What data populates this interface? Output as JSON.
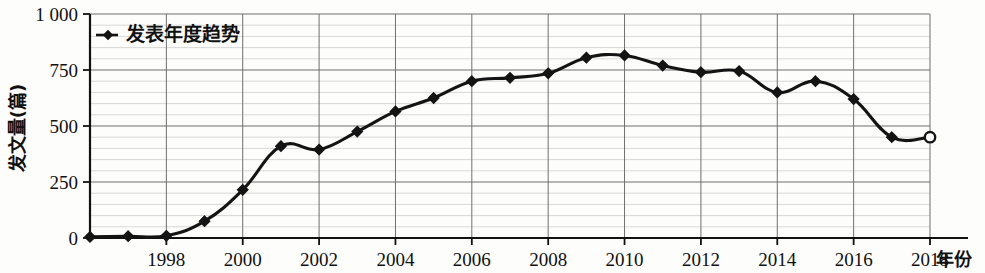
{
  "chart_data": {
    "type": "line",
    "title": "",
    "xlabel": "年份",
    "ylabel": "发文量(篇)",
    "xlim": [
      1996,
      2018
    ],
    "ylim": [
      0,
      1000
    ],
    "yticks": [
      0,
      250,
      500,
      750,
      1000
    ],
    "ytick_labels": [
      "0",
      "250",
      "500",
      "750",
      "1 000"
    ],
    "xticks": [
      1998,
      2000,
      2002,
      2004,
      2006,
      2008,
      2010,
      2012,
      2014,
      2016,
      2018
    ],
    "xtick_labels": [
      "1998",
      "2000",
      "2002",
      "2004",
      "2006",
      "2008",
      "2010",
      "2012",
      "2014",
      "2016",
      "2018"
    ],
    "grid": "major and minor horizontal, major vertical",
    "legend_position": "top-left inside plot",
    "series": [
      {
        "name": "发表年度趋势",
        "marker": "filled-diamond",
        "color": "#141414",
        "x": [
          1996,
          1997,
          1998,
          1999,
          2000,
          2001,
          2002,
          2003,
          2004,
          2005,
          2006,
          2007,
          2008,
          2009,
          2010,
          2011,
          2012,
          2013,
          2014,
          2015,
          2016,
          2017,
          2018
        ],
        "values": [
          5,
          8,
          10,
          75,
          215,
          410,
          395,
          475,
          565,
          625,
          700,
          715,
          735,
          805,
          815,
          770,
          740,
          745,
          650,
          700,
          620,
          450,
          450
        ],
        "last_point_style": "open-circle"
      }
    ],
    "legend": [
      {
        "label": "发表年度趋势",
        "marker": "filled-diamond",
        "color": "#141414"
      }
    ]
  },
  "axis": {
    "y_label": "发文量(篇)",
    "x_label": "年份"
  }
}
